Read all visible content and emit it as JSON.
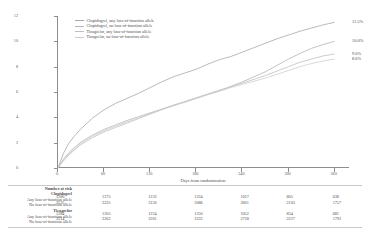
{
  "chart_data": {
    "type": "line",
    "title": "",
    "xlabel": "Days from randomization",
    "ylabel": "Event rate (%)",
    "xlim": [
      0,
      380
    ],
    "ylim": [
      0,
      12
    ],
    "xticks": [
      "0",
      "60",
      "120",
      "180",
      "240",
      "300",
      "360"
    ],
    "xtick_values": [
      0,
      60,
      120,
      180,
      240,
      300,
      360
    ],
    "yticks": [
      "0",
      "2",
      "4",
      "6",
      "8",
      "10",
      "12"
    ],
    "ytick_values": [
      0,
      2,
      4,
      6,
      8,
      10,
      12
    ],
    "grid": false,
    "legend_position": "top-left",
    "x": [
      0,
      7,
      14,
      21,
      30,
      45,
      60,
      75,
      90,
      105,
      120,
      135,
      150,
      165,
      180,
      195,
      210,
      225,
      240,
      255,
      270,
      285,
      300,
      315,
      330,
      345,
      360
    ],
    "series": [
      {
        "name": "Clopidogrel, any loss-of-function allele",
        "endpoint_label": "11.5%",
        "color": "#a8a8a8",
        "values": [
          0,
          1.15,
          1.95,
          2.5,
          3.1,
          3.95,
          4.6,
          5.1,
          5.5,
          5.9,
          6.35,
          6.8,
          7.2,
          7.5,
          7.8,
          8.2,
          8.55,
          8.8,
          9.15,
          9.5,
          9.85,
          10.2,
          10.5,
          10.8,
          11.05,
          11.3,
          11.5
        ]
      },
      {
        "name": "Clopidogrel, no loss-of-function allele",
        "endpoint_label": "10.0%",
        "color": "#b4b4b4",
        "values": [
          0,
          0.7,
          1.2,
          1.6,
          2.05,
          2.6,
          3.05,
          3.4,
          3.75,
          4.05,
          4.35,
          4.65,
          4.95,
          5.2,
          5.5,
          5.8,
          6.1,
          6.45,
          6.8,
          7.2,
          7.6,
          8.1,
          8.6,
          9.05,
          9.45,
          9.75,
          10.0
        ]
      },
      {
        "name": "Ticagrelor, any loss-of-function allele",
        "endpoint_label": "9.0%",
        "color": "#c0c0c0",
        "values": [
          0,
          0.55,
          1.0,
          1.4,
          1.85,
          2.4,
          2.85,
          3.2,
          3.55,
          3.9,
          4.25,
          4.6,
          4.95,
          5.25,
          5.55,
          5.85,
          6.15,
          6.4,
          6.7,
          7.0,
          7.3,
          7.65,
          8.0,
          8.35,
          8.6,
          8.85,
          9.0
        ]
      },
      {
        "name": "Ticagrelor, no loss-of-function allele",
        "endpoint_label": "8.6%",
        "color": "#cecece",
        "values": [
          0,
          0.6,
          1.1,
          1.5,
          1.95,
          2.5,
          2.95,
          3.3,
          3.65,
          3.95,
          4.3,
          4.6,
          4.9,
          5.2,
          5.5,
          5.8,
          6.05,
          6.35,
          6.6,
          6.85,
          7.1,
          7.4,
          7.7,
          8.0,
          8.25,
          8.45,
          8.6
        ]
      }
    ]
  },
  "risk_table": {
    "title": "Number at risk",
    "columns": [
      "0",
      "60",
      "120",
      "180",
      "240",
      "300",
      "360"
    ],
    "groups": [
      {
        "name": "Clopidogrel",
        "rows": [
          {
            "label": "Any loss-of-function allele",
            "values": [
              "1380",
              "1275",
              "1233",
              "1224",
              "1027",
              "805",
              "638"
            ]
          },
          {
            "label": "No loss-of-function allele",
            "values": [
              "3535",
              "3235",
              "3150",
              "3086",
              "2601",
              "2103",
              "1757"
            ]
          }
        ]
      },
      {
        "name": "Ticagrelor",
        "rows": [
          {
            "label": "Any loss-of-function allele",
            "values": [
              "1284",
              "1205",
              "1224",
              "1250",
              "1052",
              "834",
              "681"
            ]
          },
          {
            "label": "No loss-of-function allele",
            "values": [
              "3514",
              "3262",
              "3201",
              "3222",
              "2738",
              "2227",
              "1793"
            ]
          }
        ]
      }
    ]
  }
}
